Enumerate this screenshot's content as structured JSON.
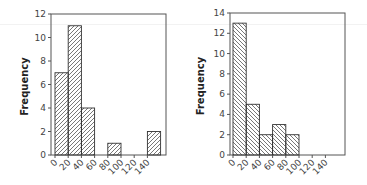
{
  "chart_data": [
    {
      "type": "bar",
      "subtype": "histogram",
      "title": "",
      "xlabel": "",
      "ylabel": "Frequency",
      "bin_edges": [
        0,
        20,
        40,
        60,
        80,
        100,
        120,
        140,
        160
      ],
      "x_tick_labels": [
        "0",
        "20",
        "40",
        "60",
        "80",
        "100",
        "120",
        "140"
      ],
      "categories": [
        "0-20",
        "20-40",
        "40-60",
        "60-80",
        "80-100",
        "100-120",
        "120-140",
        "140-160"
      ],
      "values": [
        7,
        11,
        4,
        0,
        1,
        0,
        0,
        2
      ],
      "ylim": [
        0,
        12
      ],
      "y_ticks": [
        0,
        2,
        4,
        6,
        8,
        10,
        12
      ],
      "hatch": "forward-diagonal",
      "grid": false
    },
    {
      "type": "bar",
      "subtype": "histogram",
      "title": "",
      "xlabel": "",
      "ylabel": "Frequency",
      "bin_edges": [
        0,
        20,
        40,
        60,
        80,
        100,
        120,
        140,
        160
      ],
      "x_tick_labels": [
        "0",
        "20",
        "40",
        "60",
        "80",
        "100",
        "120",
        "140"
      ],
      "categories": [
        "0-20",
        "20-40",
        "40-60",
        "60-80",
        "80-100",
        "100-120",
        "120-140",
        "140-160"
      ],
      "values": [
        13,
        5,
        2,
        3,
        2,
        0,
        0,
        0
      ],
      "ylim": [
        0,
        14
      ],
      "y_ticks": [
        0,
        2,
        4,
        6,
        8,
        10,
        12,
        14
      ],
      "hatch": "backward-diagonal",
      "grid": false
    }
  ],
  "labels": {
    "left_ylabel": "Frequency",
    "right_ylabel": "Frequency"
  }
}
